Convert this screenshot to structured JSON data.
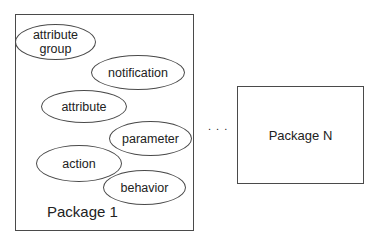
{
  "diagram": {
    "packages": [
      {
        "label": "Package 1",
        "elements": [
          {
            "label": "attribute group",
            "line1": "attribute",
            "line2": "group"
          },
          {
            "label": "notification"
          },
          {
            "label": "attribute"
          },
          {
            "label": "parameter"
          },
          {
            "label": "action"
          },
          {
            "label": "behavior"
          }
        ]
      },
      {
        "label": "Package N"
      }
    ],
    "ellipsis": ". . ."
  }
}
